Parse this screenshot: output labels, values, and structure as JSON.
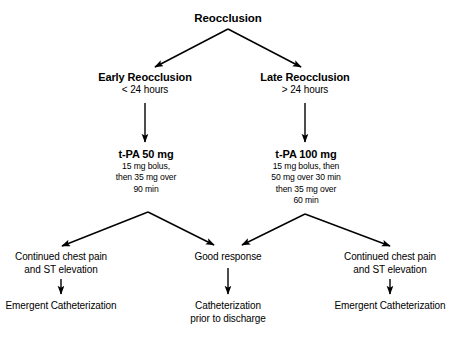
{
  "diagram": {
    "title": "Reocclusion",
    "background_color": "#ffffff",
    "line_color": "#000000",
    "root": {
      "label": "Reocclusion"
    },
    "branches": [
      {
        "label": "Early Reocclusion",
        "timing": "< 24 hours",
        "treatment_title": "t-PA 50 mg",
        "treatment_detail_1": "15 mg bolus,",
        "treatment_detail_2": "then 35 mg over",
        "treatment_detail_3": "90 min",
        "treatment_detail_4": ""
      },
      {
        "label": "Late Reocclusion",
        "timing": "> 24 hours",
        "treatment_title": "t-PA 100 mg",
        "treatment_detail_1": "15 mg bolus, then",
        "treatment_detail_2": "50 mg over 30 min",
        "treatment_detail_3": "then 35 mg over",
        "treatment_detail_4": "60 min"
      }
    ],
    "outcomes": {
      "left": {
        "condition_line_1": "Continued chest pain",
        "condition_line_2": "and ST elevation",
        "action_line_1": "Emergent Catheterization",
        "action_line_2": ""
      },
      "center": {
        "condition_line_1": "Good response",
        "condition_line_2": "",
        "action_line_1": "Catheterization",
        "action_line_2": "prior to discharge"
      },
      "right": {
        "condition_line_1": "Continued chest pain",
        "condition_line_2": "and ST elevation",
        "action_line_1": "Emergent Catheterization",
        "action_line_2": ""
      }
    }
  }
}
